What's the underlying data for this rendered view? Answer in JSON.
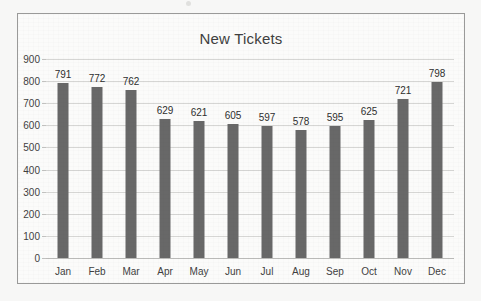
{
  "chart_data": {
    "type": "bar",
    "title": "New Tickets",
    "xlabel": "",
    "ylabel": "",
    "categories": [
      "Jan",
      "Feb",
      "Mar",
      "Apr",
      "May",
      "Jun",
      "Jul",
      "Aug",
      "Sep",
      "Oct",
      "Nov",
      "Dec"
    ],
    "values": [
      791,
      772,
      762,
      629,
      621,
      605,
      597,
      578,
      595,
      625,
      721,
      798
    ],
    "data_labels": [
      "791",
      "772",
      "762",
      "629",
      "621",
      "605",
      "597",
      "578",
      "595",
      "625",
      "721",
      "798"
    ],
    "ylim": [
      0,
      900
    ],
    "ytick_step": 100,
    "ytick_labels": [
      "900",
      "800",
      "700",
      "600",
      "500",
      "400",
      "300",
      "200",
      "100",
      "0"
    ],
    "ytick_values": [
      900,
      800,
      700,
      600,
      500,
      400,
      300,
      200,
      100,
      0
    ],
    "grid": "horizontal",
    "legend": "none",
    "bar_color": "#686868",
    "gridline_color": "#d6d6d4",
    "axis_text_color": "#3f3f3f",
    "plot_background": "#fbfbfa",
    "frame_border_color": "#9a9a99"
  }
}
